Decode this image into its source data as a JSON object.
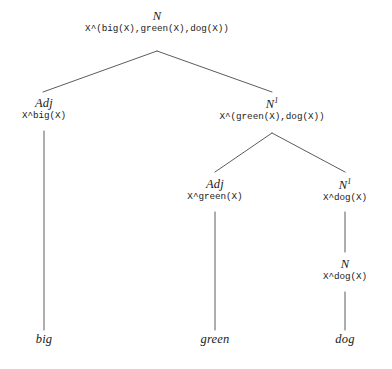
{
  "diagram": {
    "background_color": "#ffffff",
    "line_color": "#4a4a4a",
    "text_color": "#1a1a1a"
  },
  "nodes": {
    "root": {
      "category": "N",
      "superscript": "",
      "semantics": "X^(big(X),green(X),dog(X))"
    },
    "adj_big": {
      "category": "Adj",
      "superscript": "",
      "semantics": "X^big(X)"
    },
    "n1_top": {
      "category": "N",
      "superscript": "1",
      "semantics": "X^(green(X),dog(X))"
    },
    "adj_green": {
      "category": "Adj",
      "superscript": "",
      "semantics": "X^green(X)"
    },
    "n1_dog": {
      "category": "N",
      "superscript": "1",
      "semantics": "X^dog(X)"
    },
    "n_dog": {
      "category": "N",
      "superscript": "",
      "semantics": "X^dog(X)"
    }
  },
  "leaves": {
    "big": "big",
    "green": "green",
    "dog": "dog"
  }
}
